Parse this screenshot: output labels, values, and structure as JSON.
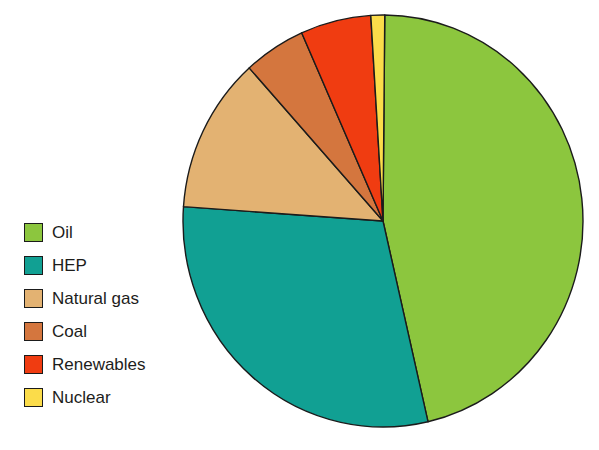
{
  "chart_data": {
    "type": "pie",
    "title": "",
    "subtitle": "",
    "xlabel": "",
    "ylabel": "",
    "grid": false,
    "legend_position": "left",
    "units": "percent",
    "start_angle_deg": 0.5,
    "direction": "clockwise",
    "categories": [
      "Oil",
      "HEP",
      "Natural gas",
      "Coal",
      "Renewables",
      "Nuclear"
    ],
    "values": [
      46.3,
      29.7,
      12.2,
      5.0,
      5.7,
      1.1
    ],
    "slices": [
      {
        "label": "Oil",
        "value": 46.3,
        "color": "#8cc63e",
        "start_deg": 0.5,
        "end_deg": 167.0
      },
      {
        "label": "HEP",
        "value": 29.7,
        "color": "#11a093",
        "start_deg": 167.0,
        "end_deg": 274.0
      },
      {
        "label": "Natural gas",
        "value": 12.2,
        "color": "#e3b272",
        "start_deg": 274.0,
        "end_deg": 318.0
      },
      {
        "label": "Coal",
        "value": 5.0,
        "color": "#d4763e",
        "start_deg": 318.0,
        "end_deg": 336.0
      },
      {
        "label": "Renewables",
        "value": 5.7,
        "color": "#f03c11",
        "start_deg": 336.0,
        "end_deg": 356.5
      },
      {
        "label": "Nuclear",
        "value": 1.1,
        "color": "#fbdc4a",
        "start_deg": 356.5,
        "end_deg": 360.5
      }
    ]
  },
  "legend": {
    "items": [
      {
        "label": "Oil",
        "color": "#8cc63e"
      },
      {
        "label": "HEP",
        "color": "#11a093"
      },
      {
        "label": "Natural gas",
        "color": "#e3b272"
      },
      {
        "label": "Coal",
        "color": "#d4763e"
      },
      {
        "label": "Renewables",
        "color": "#f03c11"
      },
      {
        "label": "Nuclear",
        "color": "#fbdc4a"
      }
    ]
  },
  "pie": {
    "center_x": 203,
    "center_y": 211,
    "radius_x": 200,
    "radius_y": 206,
    "outline_color": "#1b1b1b",
    "outline_width": 1.4
  }
}
